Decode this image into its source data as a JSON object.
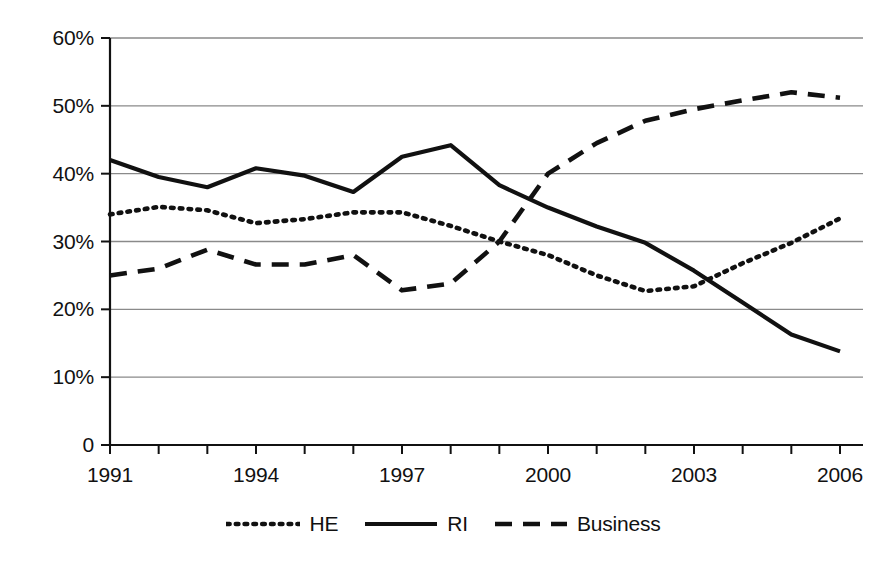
{
  "chart_data": {
    "type": "line",
    "title": "",
    "xlabel": "",
    "ylabel": "",
    "x": [
      1991,
      1992,
      1993,
      1994,
      1995,
      1996,
      1997,
      1998,
      1999,
      2000,
      2001,
      2002,
      2003,
      2004,
      2005,
      2006
    ],
    "xlim": [
      1991,
      2006
    ],
    "ylim": [
      0,
      60
    ],
    "yticks": [
      0,
      10,
      20,
      30,
      40,
      50,
      60
    ],
    "ytick_labels": [
      "0",
      "10%",
      "20%",
      "30%",
      "40%",
      "50%",
      "60%"
    ],
    "xticks": [
      1991,
      1992,
      1993,
      1994,
      1995,
      1996,
      1997,
      1998,
      1999,
      2000,
      2001,
      2002,
      2003,
      2004,
      2005,
      2006
    ],
    "xtick_labels": [
      "1991",
      "",
      "",
      "1994",
      "",
      "",
      "1997",
      "",
      "",
      "2000",
      "",
      "",
      "2003",
      "",
      "",
      "2006"
    ],
    "xtick_labels_shown": [
      "1991",
      "1994",
      "1997",
      "2000",
      "2003",
      "2006"
    ],
    "grid": "horizontal",
    "legend_position": "bottom-center",
    "series": [
      {
        "name": "HE",
        "style": "dotted",
        "color": "#111111",
        "values": [
          34.0,
          35.1,
          34.6,
          32.7,
          33.3,
          34.3,
          34.3,
          32.3,
          30.0,
          28.0,
          25.0,
          22.7,
          23.4,
          26.8,
          29.8,
          33.4
        ]
      },
      {
        "name": "RI",
        "style": "solid",
        "color": "#111111",
        "values": [
          42.0,
          39.5,
          38.0,
          40.8,
          39.7,
          37.3,
          42.5,
          44.2,
          38.3,
          35.0,
          32.2,
          29.8,
          25.7,
          21.0,
          16.3,
          13.8
        ]
      },
      {
        "name": "Business",
        "style": "dashed",
        "color": "#111111",
        "values": [
          25.0,
          26.0,
          28.8,
          26.6,
          26.6,
          28.0,
          22.8,
          23.8,
          30.0,
          40.0,
          44.5,
          47.8,
          49.5,
          50.8,
          52.0,
          51.2
        ]
      }
    ]
  },
  "legend": {
    "items": [
      {
        "label": "HE",
        "style": "dotted"
      },
      {
        "label": "RI",
        "style": "solid"
      },
      {
        "label": "Business",
        "style": "dashed"
      }
    ]
  },
  "geometry": {
    "plot_left": 110,
    "plot_right": 863,
    "plot_top": 38,
    "plot_bottom": 445,
    "data_left": 110,
    "data_right": 840
  }
}
